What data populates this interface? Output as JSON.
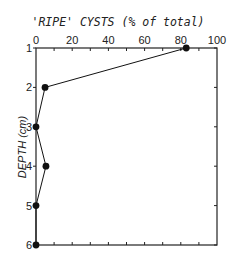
{
  "chart_data": {
    "type": "line",
    "title": "'RIPE' CYSTS (% of total)",
    "xlabel": "'RIPE' CYSTS (% of total)",
    "ylabel": "DEPTH (cm)",
    "x_axis_position": "top",
    "y_axis_inverted": true,
    "xlim": [
      0,
      100
    ],
    "ylim": [
      1,
      6
    ],
    "x_ticks": [
      0,
      20,
      40,
      60,
      80,
      100
    ],
    "y_ticks": [
      1,
      2,
      3,
      4,
      5,
      6
    ],
    "grid": false,
    "legend": null,
    "series": [
      {
        "name": "Ripe cysts",
        "depth": [
          1,
          2,
          3,
          4,
          5,
          6
        ],
        "values": [
          83,
          5,
          0,
          5.5,
          0,
          0
        ],
        "marker": "filled-circle",
        "color": "#111111"
      }
    ]
  },
  "labels": {
    "title": "'RIPE' CYSTS (% of total)",
    "ylabel": "DEPTH (cm)",
    "x_ticks": [
      "0",
      "20",
      "40",
      "60",
      "80",
      "100"
    ],
    "y_ticks": [
      "1",
      "2",
      "3",
      "4",
      "5",
      "6"
    ]
  },
  "colors": {
    "line": "#111111",
    "axis": "#222222",
    "background": "#ffffff"
  }
}
